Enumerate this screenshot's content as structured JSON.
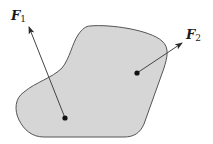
{
  "diagram": {
    "type": "rigid-body-forces",
    "body": {
      "fill": "#d6d6d6",
      "stroke": "#555555"
    },
    "forces": [
      {
        "name": "F",
        "subscript": "1",
        "color": "#444444"
      },
      {
        "name": "F",
        "subscript": "2",
        "color": "#444444"
      }
    ]
  }
}
